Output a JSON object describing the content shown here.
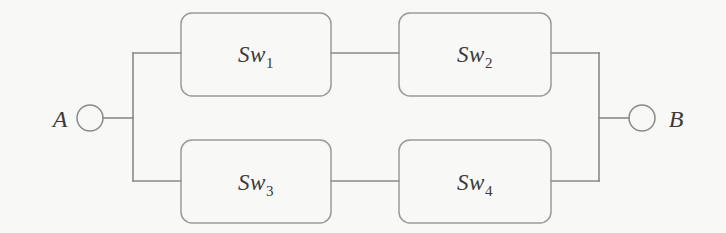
{
  "diagram": {
    "type": "reliability-block-diagram",
    "background_color": "#f8f8f6",
    "line_color": "#8a8a8a",
    "text_color": "#3a3a3a",
    "terminals": [
      {
        "id": "A",
        "label": "A",
        "side": "left"
      },
      {
        "id": "B",
        "label": "B",
        "side": "right"
      }
    ],
    "blocks": [
      {
        "id": "sw1",
        "base": "Sw",
        "subscript": "1",
        "label": "Sw1",
        "row": "top",
        "column": 1
      },
      {
        "id": "sw2",
        "base": "Sw",
        "subscript": "2",
        "label": "Sw2",
        "row": "top",
        "column": 2
      },
      {
        "id": "sw3",
        "base": "Sw",
        "subscript": "3",
        "label": "Sw3",
        "row": "bottom",
        "column": 1
      },
      {
        "id": "sw4",
        "base": "Sw",
        "subscript": "4",
        "label": "Sw4",
        "row": "bottom",
        "column": 2
      }
    ]
  }
}
